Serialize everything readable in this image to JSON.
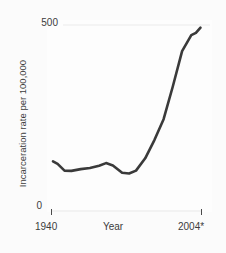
{
  "chart_data": {
    "type": "line",
    "title": "",
    "subtitle": "",
    "xlabel": "Year",
    "ylabel": "Incarceration rate per 100,000",
    "xlim": [
      1940,
      2004
    ],
    "ylim": [
      0,
      500
    ],
    "x_tick_labels": [
      "1940",
      "2004*"
    ],
    "y_tick_labels": [
      "0",
      "500"
    ],
    "grid": "single horizontal gridline at y = 500",
    "legend": "none",
    "annotations": [
      "* asterisk on 2004 denotes provisional/estimated value"
    ],
    "series": [
      {
        "name": "Incarceration rate per 100,000",
        "color": "#3a3a3a",
        "x": [
          1940,
          1942,
          1945,
          1948,
          1952,
          1956,
          1960,
          1963,
          1966,
          1970,
          1973,
          1976,
          1980,
          1984,
          1988,
          1992,
          1996,
          2000,
          2002,
          2004
        ],
        "values": [
          131,
          124,
          106,
          105,
          110,
          113,
          119,
          126,
          120,
          100,
          98,
          106,
          139,
          188,
          244,
          332,
          427,
          470,
          476,
          490
        ]
      }
    ]
  },
  "axes": {
    "y_top_label": "500",
    "y_bottom_label": "0",
    "y_title": "Incarceration rate per 100,000",
    "x_start_label": "1940",
    "x_end_label": "2004*",
    "x_title": "Year"
  },
  "colors": {
    "line": "#3a3a3a",
    "text": "#3b3b3b",
    "gridline": "#f4f4f4",
    "axis": "#f2f2f2",
    "tick": "#4a4a4a",
    "panel_background": "#fdfdfd",
    "figure_background": "#fbfbfb"
  }
}
